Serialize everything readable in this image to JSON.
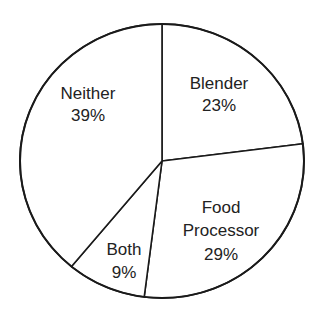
{
  "chart_data": {
    "type": "pie",
    "title": "",
    "start_angle_deg": 0,
    "direction": "clockwise",
    "categories": [
      "Blender",
      "Food Processor",
      "Both",
      "Neither"
    ],
    "values": [
      23,
      29,
      9,
      39
    ],
    "unit": "%",
    "slices": [
      {
        "name": "Blender",
        "value": 23,
        "label": "23%",
        "lines": [
          "Blender",
          "23%"
        ]
      },
      {
        "name": "Food Processor",
        "value": 29,
        "label": "29%",
        "lines": [
          "Food",
          "Processor",
          "29%"
        ]
      },
      {
        "name": "Both",
        "value": 9,
        "label": "9%",
        "lines": [
          "Both",
          "9%"
        ]
      },
      {
        "name": "Neither",
        "value": 39,
        "label": "39%",
        "lines": [
          "Neither",
          "39%"
        ]
      }
    ],
    "legend": "none",
    "colors": {
      "fill": "#ffffff",
      "stroke": "#1a1a1a",
      "text": "#222222"
    }
  },
  "labels": {
    "blender": {
      "name": "Blender",
      "pct": "23%"
    },
    "food_processor": {
      "line1": "Food",
      "line2": "Processor",
      "pct": "29%"
    },
    "both": {
      "name": "Both",
      "pct": "9%"
    },
    "neither": {
      "name": "Neither",
      "pct": "39%"
    }
  }
}
